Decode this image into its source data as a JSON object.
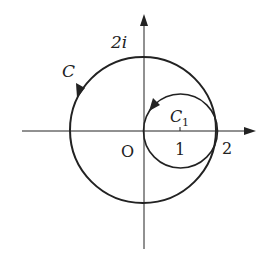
{
  "diagram": {
    "type": "complex-plane contour diagram",
    "axes": {
      "x_arrow": true,
      "y_arrow": true,
      "origin_label": "O"
    },
    "labels": {
      "imag_tick": "2i",
      "real_tick_1": "1",
      "real_tick_2": "2",
      "curve_C": "C",
      "curve_C1_main": "C",
      "curve_C1_sub": "1"
    },
    "curves": [
      {
        "name": "C",
        "center": [
          0,
          0
        ],
        "radius": 2,
        "orientation": "counterclockwise"
      },
      {
        "name": "C1",
        "center": [
          1,
          0
        ],
        "radius": 1,
        "orientation": "counterclockwise"
      }
    ],
    "line_color": "#222222"
  }
}
